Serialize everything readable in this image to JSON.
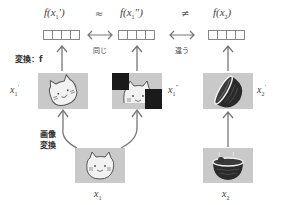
{
  "top_row": {
    "features": [
      {
        "id": "f_x1_prime",
        "label": "f(x₁′)",
        "cells": 4
      },
      {
        "id": "f_x1_dprime",
        "label": "f(x₁″)",
        "cells": 4
      },
      {
        "id": "f_x2",
        "label": "f(x₂)",
        "cells": 4
      }
    ],
    "relations": [
      {
        "symbol": "≈",
        "arrow": "⟷",
        "label": "同じ"
      },
      {
        "symbol": "≠",
        "arrow": "⟷",
        "label": "違う"
      }
    ]
  },
  "transform_label": "変換：f",
  "augment_label_line1": "画像",
  "augment_label_line2": "変換",
  "images": {
    "x1_prime": {
      "label": "x₁′",
      "content": "rotated cat"
    },
    "x1_dprime": {
      "label": "x₁″",
      "content": "cat with black square occlusions"
    },
    "x2_prime": {
      "label": "x₂′",
      "content": "rotated bowl of noodles"
    },
    "x1": {
      "label": "x₁",
      "content": "cat face"
    },
    "x2": {
      "label": "x₂",
      "content": "bowl of noodles"
    }
  },
  "colors": {
    "image_bg": "#c9c9c9",
    "arrow": "#777777",
    "occlusion": "#1a1a1a",
    "bowl": "#2a2a2a"
  }
}
